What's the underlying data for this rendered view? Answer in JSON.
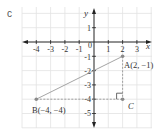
{
  "question_label": "c",
  "axes": {
    "x_label": "x",
    "y_label": "y",
    "x_ticks": [
      "-4",
      "-3",
      "-2",
      "-1",
      "0",
      "1",
      "2",
      "3"
    ],
    "y_ticks": [
      "1",
      "-1",
      "-2",
      "-3",
      "-4",
      "-5"
    ]
  },
  "points": {
    "A": {
      "label": "A(2, −1)",
      "x": 2,
      "y": -1
    },
    "B": {
      "label": "B(−4, −4)",
      "x": -4,
      "y": -4
    },
    "C": {
      "label": "C",
      "x": 2,
      "y": -4
    }
  },
  "colors": {
    "grid": "#e2e2e2",
    "axis": "#222222",
    "segment": "#9a9a9a",
    "point": "#8a8a8a"
  }
}
